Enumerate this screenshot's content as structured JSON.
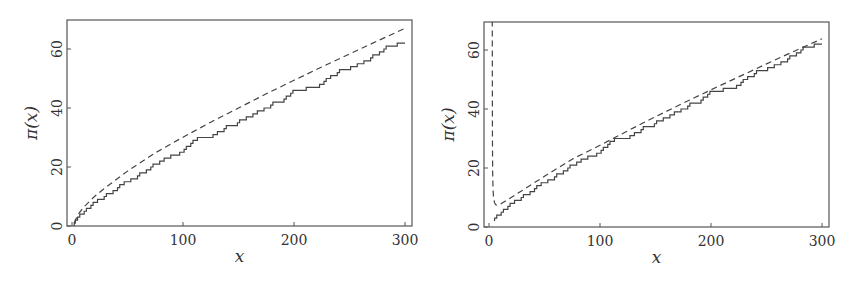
{
  "chart_data": [
    {
      "type": "line",
      "title": "",
      "xlabel": "x",
      "ylabel": "π(x)",
      "xlim": [
        -4,
        308
      ],
      "ylim": [
        0,
        70
      ],
      "xticks": [
        0,
        100,
        200,
        300
      ],
      "yticks": [
        0,
        20,
        40,
        60
      ],
      "grid": false,
      "legend": null,
      "series": [
        {
          "name": "π(x)",
          "style": "solid-step",
          "primes": [
            2,
            3,
            5,
            7,
            11,
            13,
            17,
            19,
            23,
            29,
            31,
            37,
            41,
            43,
            47,
            53,
            59,
            61,
            67,
            71,
            73,
            79,
            83,
            89,
            97,
            101,
            103,
            107,
            109,
            113,
            127,
            131,
            137,
            139,
            149,
            151,
            157,
            163,
            167,
            173,
            179,
            181,
            191,
            193,
            197,
            199,
            211,
            223,
            227,
            229,
            233,
            239,
            241,
            251,
            257,
            263,
            269,
            271,
            277,
            281,
            283,
            293
          ],
          "x_end": 300,
          "final_value": 62
        },
        {
          "name": "li(x)",
          "style": "dashed",
          "x": [
            2,
            5,
            10,
            20,
            30,
            50,
            75,
            100,
            125,
            150,
            175,
            200,
            225,
            250,
            275,
            300
          ],
          "values": [
            1.05,
            3.63,
            6.17,
            9.9,
            13.0,
            18.6,
            24.8,
            30.1,
            35.2,
            40.0,
            44.8,
            49.4,
            53.9,
            58.3,
            62.7,
            67.0
          ]
        }
      ]
    },
    {
      "type": "line",
      "title": "",
      "xlabel": "x",
      "ylabel": "π(x)",
      "xlim": [
        -4,
        308
      ],
      "ylim": [
        0,
        70
      ],
      "xticks": [
        0,
        100,
        200,
        300
      ],
      "yticks": [
        0,
        20,
        40,
        60
      ],
      "grid": false,
      "legend": null,
      "series": [
        {
          "name": "π(x)",
          "style": "solid-step",
          "primes": [
            2,
            3,
            5,
            7,
            11,
            13,
            17,
            19,
            23,
            29,
            31,
            37,
            41,
            43,
            47,
            53,
            59,
            61,
            67,
            71,
            73,
            79,
            83,
            89,
            97,
            101,
            103,
            107,
            109,
            113,
            127,
            131,
            137,
            139,
            149,
            151,
            157,
            163,
            167,
            173,
            179,
            181,
            191,
            193,
            197,
            199,
            211,
            223,
            227,
            229,
            233,
            239,
            241,
            251,
            257,
            263,
            269,
            271,
            277,
            281,
            283,
            293
          ],
          "x_start": 5,
          "x_end": 300,
          "final_value": 62
        },
        {
          "name": "x/(ln x - 1)",
          "style": "dashed",
          "x": [
            2.95,
            3.1,
            3.3,
            3.6,
            4,
            5,
            6,
            7.39,
            10,
            20,
            30,
            50,
            75,
            100,
            125,
            150,
            175,
            200,
            225,
            250,
            275,
            300
          ],
          "values": [
            70,
            31.0,
            18.5,
            12.9,
            10.4,
            8.2,
            7.55,
            7.39,
            7.68,
            10.0,
            12.4,
            17.2,
            23.0,
            27.7,
            32.6,
            37.4,
            42.0,
            46.5,
            50.9,
            55.3,
            59.6,
            63.8
          ]
        }
      ]
    }
  ]
}
